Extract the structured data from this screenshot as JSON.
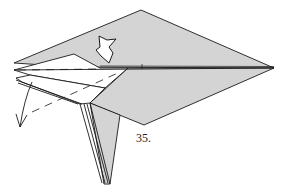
{
  "diagram": {
    "step_number": "35.",
    "colors": {
      "paper_colored": "#d4d4d4",
      "paper_white": "#ffffff",
      "line": "#1a1a1a"
    },
    "symbols": [
      "push-arrow",
      "fold-arrow",
      "valley-fold-line"
    ]
  }
}
